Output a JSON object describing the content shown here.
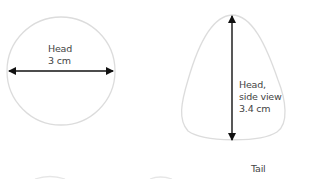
{
  "diagram": {
    "front_view": {
      "label_line1": "Head",
      "label_line2": "3 cm"
    },
    "side_view": {
      "label_line1": "Head,",
      "label_line2": "side view",
      "label_line3": "3.4 cm"
    },
    "tail": {
      "label": "Tail"
    },
    "colors": {
      "outline": "#dcdcdc",
      "arrow": "#111111",
      "text": "#444444"
    }
  }
}
